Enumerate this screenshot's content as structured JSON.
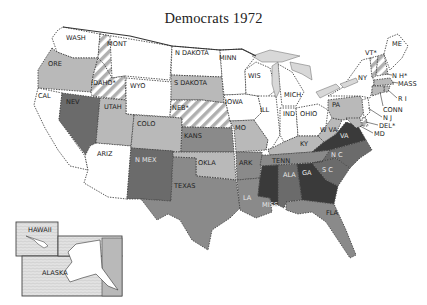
{
  "title": "Democrats 1972",
  "shades": {
    "white": "#ffffff",
    "light": "#b9b9b9",
    "medium": "#8a8a8a",
    "dark": "#6b6b6b",
    "darkest": "#3a3a3a",
    "hatch_fg": "#b0b0b0",
    "lake": "#d8d8d8"
  },
  "states": {
    "WASH": {
      "label": "WASH",
      "shade": "white"
    },
    "ORE": {
      "label": "ORE",
      "shade": "light"
    },
    "CAL": {
      "label": "CAL",
      "shade": "white"
    },
    "MONT": {
      "label": "MONT",
      "shade": "white"
    },
    "IDAHO": {
      "label": "IDAHO*",
      "shade": "hatched"
    },
    "NEV": {
      "label": "NEV",
      "shade": "dark"
    },
    "WYO": {
      "label": "WYO",
      "shade": "white"
    },
    "UTAH": {
      "label": "UTAH",
      "shade": "light"
    },
    "ARIZ": {
      "label": "ARIZ",
      "shade": "white"
    },
    "COLO": {
      "label": "COLO",
      "shade": "light"
    },
    "NMEX": {
      "label": "N MEX",
      "shade": "dark"
    },
    "NDAK": {
      "label": "N DAKOTA",
      "shade": "white"
    },
    "SDAK": {
      "label": "S DAKOTA",
      "shade": "light"
    },
    "NEB": {
      "label": "NEB*",
      "shade": "hatched"
    },
    "KANS": {
      "label": "KANS",
      "shade": "medium"
    },
    "OKLA": {
      "label": "OKLA",
      "shade": "light"
    },
    "TEXAS": {
      "label": "TEXAS",
      "shade": "medium"
    },
    "MINN": {
      "label": "MINN",
      "shade": "white"
    },
    "IOWA": {
      "label": "IOWA",
      "shade": "white"
    },
    "MO": {
      "label": "MO",
      "shade": "light"
    },
    "ARK": {
      "label": "ARK",
      "shade": "medium"
    },
    "LA": {
      "label": "LA",
      "shade": "medium"
    },
    "WIS": {
      "label": "WIS",
      "shade": "white"
    },
    "ILL": {
      "label": "ILL",
      "shade": "white"
    },
    "MICH": {
      "label": "MICH",
      "shade": "white"
    },
    "IND": {
      "label": "IND",
      "shade": "white"
    },
    "OHIO": {
      "label": "OHIO",
      "shade": "white"
    },
    "KY": {
      "label": "KY",
      "shade": "light"
    },
    "TENN": {
      "label": "TENN",
      "shade": "medium"
    },
    "MISS": {
      "label": "MISS",
      "shade": "darkest"
    },
    "ALA": {
      "label": "ALA",
      "shade": "dark"
    },
    "GA": {
      "label": "GA",
      "shade": "darkest"
    },
    "FLA": {
      "label": "FLA",
      "shade": "medium"
    },
    "SC": {
      "label": "S C",
      "shade": "dark"
    },
    "NC": {
      "label": "N C",
      "shade": "dark"
    },
    "VA": {
      "label": "VA",
      "shade": "darkest"
    },
    "WVA": {
      "label": "W VA",
      "shade": "light"
    },
    "PA": {
      "label": "PA",
      "shade": "light"
    },
    "NY": {
      "label": "NY",
      "shade": "white"
    },
    "ME": {
      "label": "ME",
      "shade": "white"
    },
    "VT": {
      "label": "VT*",
      "shade": "hatched"
    },
    "NH": {
      "label": "N H*",
      "shade": "hatched"
    },
    "MASS": {
      "label": "MASS",
      "shade": "light"
    },
    "RI": {
      "label": "R I",
      "shade": "light"
    },
    "CONN": {
      "label": "CONN",
      "shade": "light"
    },
    "NJ": {
      "label": "N J",
      "shade": "white"
    },
    "DEL": {
      "label": "DEL*",
      "shade": "hatched"
    },
    "MD": {
      "label": "MD",
      "shade": "light"
    }
  },
  "insets": {
    "hawaii": {
      "label": "HAWAII",
      "shade": "white"
    },
    "alaska": {
      "label": "ALASKA",
      "shade": "white"
    }
  }
}
